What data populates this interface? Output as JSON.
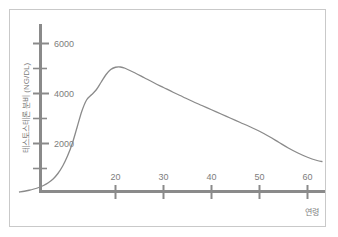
{
  "figure": {
    "background_color": "#ffffff",
    "frame_color": "#c9c9c9",
    "axis_color": "#8a8a8a",
    "curve_color": "#8a8a8a",
    "text_color": "#7d7d7d"
  },
  "chart_data": {
    "type": "line",
    "title": "",
    "subtitle": "",
    "xlabel": "연령",
    "ylabel": "테스토스테론 분비 (NG/DL)",
    "xlim": [
      0,
      64
    ],
    "ylim": [
      0,
      7000
    ],
    "grid": false,
    "legend": null,
    "xticks": [
      20,
      30,
      40,
      50,
      60
    ],
    "xtick_labels": [
      "20",
      "30",
      "40",
      "50",
      "60"
    ],
    "yticks": [
      1000,
      2000,
      3000,
      4000,
      5000,
      6000
    ],
    "ytick_labels": [
      "",
      "2000",
      "",
      "4000",
      "",
      "6000"
    ],
    "ylabeled_ticks": [
      {
        "value": 6000,
        "label": "6000"
      },
      {
        "value": 4000,
        "label": "4000"
      },
      {
        "value": 2000,
        "label": "2000"
      }
    ],
    "series": [
      {
        "name": "테스토스테론 분비",
        "x": [
          0,
          1,
          2,
          3,
          4,
          5,
          6,
          7,
          8,
          9,
          10,
          11,
          12,
          13,
          14,
          15,
          16,
          17,
          18,
          19,
          20,
          21,
          22,
          24,
          26,
          28,
          30,
          32,
          34,
          36,
          38,
          40,
          42,
          44,
          46,
          48,
          50,
          52,
          54,
          56,
          58,
          60,
          62,
          63
        ],
        "y": [
          60,
          90,
          130,
          180,
          240,
          320,
          430,
          580,
          800,
          1100,
          1500,
          2000,
          2650,
          3300,
          3750,
          3950,
          4150,
          4450,
          4750,
          4960,
          5050,
          5060,
          5010,
          4830,
          4630,
          4430,
          4240,
          4050,
          3870,
          3690,
          3520,
          3350,
          3180,
          3010,
          2840,
          2670,
          2490,
          2280,
          2050,
          1820,
          1620,
          1450,
          1320,
          1280
        ]
      }
    ]
  },
  "annotations": {
    "peak_note": "",
    "axis_arrow": false
  }
}
